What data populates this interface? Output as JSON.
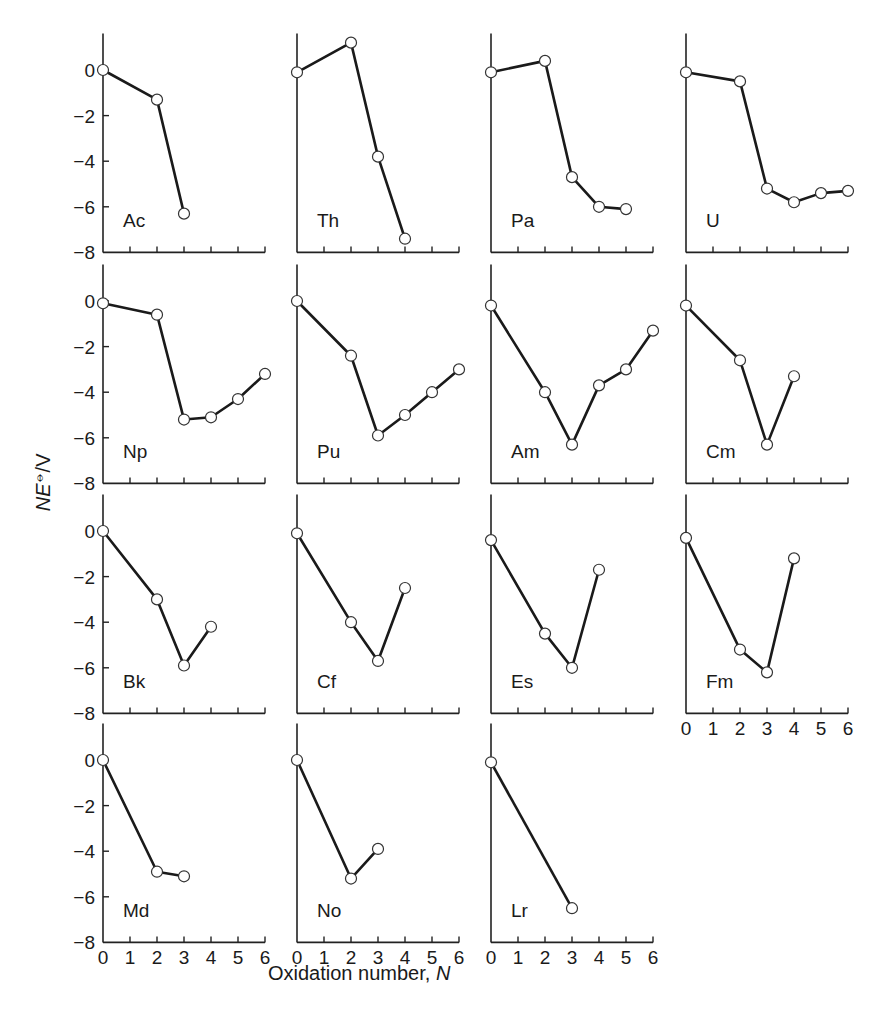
{
  "figure": {
    "ylabel": "NE⦵/V",
    "ylabel_parts": {
      "italic": "NE",
      "super": "⦵",
      "rest": "/V"
    },
    "xlabel_text": "Oxidation number, ",
    "xlabel_italic": "N",
    "y_ticks": [
      "0",
      "−2",
      "−4",
      "−6",
      "−8"
    ],
    "x_ticks": [
      "0",
      "1",
      "2",
      "3",
      "4",
      "5",
      "6"
    ]
  },
  "chart_data": {
    "type": "line",
    "xlabel": "Oxidation number, N",
    "ylabel": "NE⦵/V",
    "xlim": [
      0,
      6
    ],
    "ylim": [
      -8,
      1.5
    ],
    "grid": false,
    "panels": [
      {
        "element": "Ac",
        "x": [
          0,
          2,
          3
        ],
        "y": [
          0,
          -1.3,
          -6.3
        ]
      },
      {
        "element": "Th",
        "x": [
          0,
          2,
          3,
          4
        ],
        "y": [
          -0.1,
          1.2,
          -3.8,
          -7.4
        ]
      },
      {
        "element": "Pa",
        "x": [
          0,
          2,
          3,
          4,
          5
        ],
        "y": [
          -0.1,
          0.4,
          -4.7,
          -6.0,
          -6.1
        ]
      },
      {
        "element": "U",
        "x": [
          0,
          2,
          3,
          4,
          5,
          6
        ],
        "y": [
          -0.1,
          -0.5,
          -5.2,
          -5.8,
          -5.4,
          -5.3
        ]
      },
      {
        "element": "Np",
        "x": [
          0,
          2,
          3,
          4,
          5,
          6
        ],
        "y": [
          -0.1,
          -0.6,
          -5.2,
          -5.1,
          -4.3,
          -3.2
        ]
      },
      {
        "element": "Pu",
        "x": [
          0,
          2,
          3,
          4,
          5,
          6
        ],
        "y": [
          0,
          -2.4,
          -5.9,
          -5.0,
          -4.0,
          -3.0
        ]
      },
      {
        "element": "Am",
        "x": [
          0,
          2,
          3,
          4,
          5,
          6
        ],
        "y": [
          -0.2,
          -4.0,
          -6.3,
          -3.7,
          -3.0,
          -1.3
        ]
      },
      {
        "element": "Cm",
        "x": [
          0,
          2,
          3,
          4
        ],
        "y": [
          -0.2,
          -2.6,
          -6.3,
          -3.3
        ]
      },
      {
        "element": "Bk",
        "x": [
          0,
          2,
          3,
          4
        ],
        "y": [
          0,
          -3.0,
          -5.9,
          -4.2
        ]
      },
      {
        "element": "Cf",
        "x": [
          0,
          2,
          3,
          4
        ],
        "y": [
          -0.1,
          -4.0,
          -5.7,
          -2.5
        ]
      },
      {
        "element": "Es",
        "x": [
          0,
          2,
          3,
          4
        ],
        "y": [
          -0.4,
          -4.5,
          -6.0,
          -1.7
        ]
      },
      {
        "element": "Fm",
        "x": [
          0,
          2,
          3,
          4
        ],
        "y": [
          -0.3,
          -5.2,
          -6.2,
          -1.2
        ]
      },
      {
        "element": "Md",
        "x": [
          0,
          2,
          3
        ],
        "y": [
          0,
          -4.9,
          -5.1
        ]
      },
      {
        "element": "No",
        "x": [
          0,
          2,
          3
        ],
        "y": [
          0,
          -5.2,
          -3.9
        ]
      },
      {
        "element": "Lr",
        "x": [
          0,
          3
        ],
        "y": [
          -0.1,
          -6.5
        ]
      }
    ],
    "layout": {
      "rows": 4,
      "cols": 4,
      "col_x0": [
        103,
        297,
        491,
        686
      ],
      "row_y0": [
        70,
        301,
        531,
        760
      ],
      "px_per_x": 27,
      "px_per_y": 22.8,
      "y_ticks_on_cols": [
        0
      ],
      "x_tick_labels_on": [
        "Fm",
        "Md",
        "No",
        "Lr"
      ]
    }
  }
}
